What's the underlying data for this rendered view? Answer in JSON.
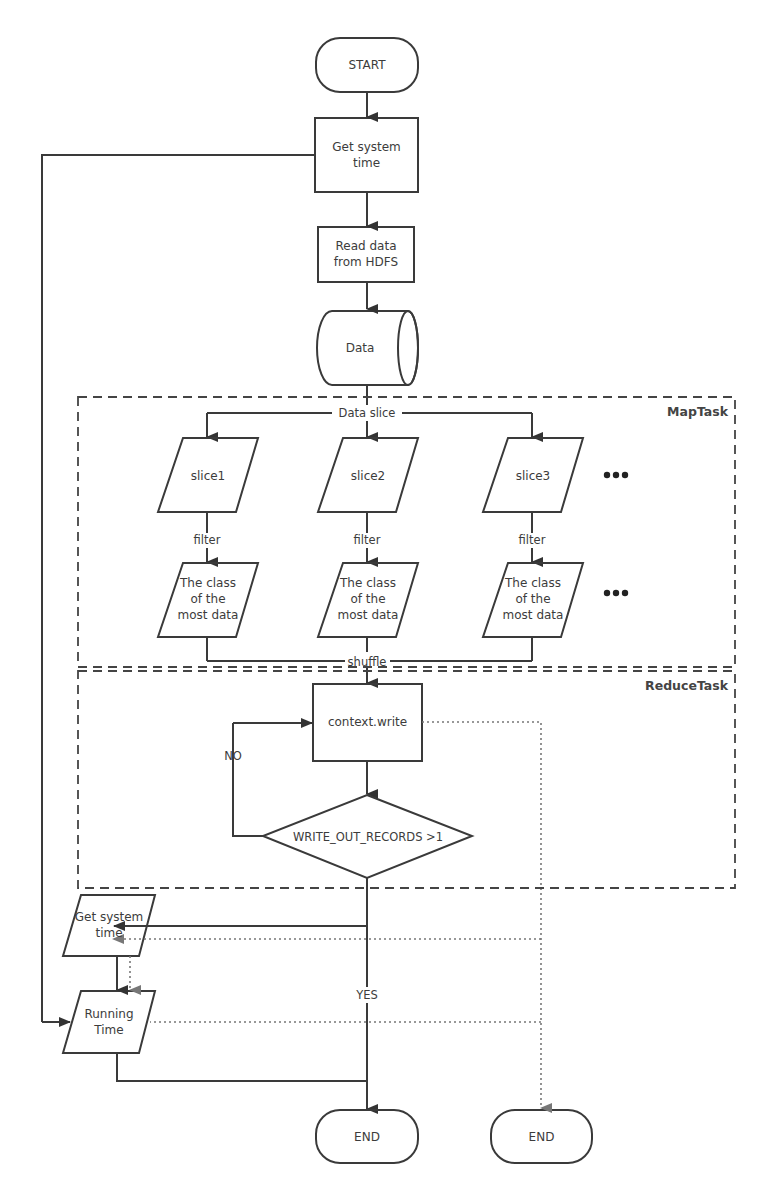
{
  "diagram": {
    "type": "flowchart",
    "groups": {
      "map": {
        "label": "MapTask"
      },
      "reduce": {
        "label": "ReduceTask"
      }
    },
    "nodes": {
      "start": {
        "label": "START",
        "shape": "terminator"
      },
      "get_time_1": {
        "line1": "Get system",
        "line2": "time",
        "shape": "process"
      },
      "read_data": {
        "line1": "Read data",
        "line2": "from HDFS",
        "shape": "process"
      },
      "data": {
        "label": "Data",
        "shape": "cylinder"
      },
      "slices": [
        {
          "label": "slice1",
          "shape": "parallelogram"
        },
        {
          "label": "slice2",
          "shape": "parallelogram"
        },
        {
          "label": "slice3",
          "shape": "parallelogram"
        }
      ],
      "classes": [
        {
          "line1": "The class",
          "line2": "of the",
          "line3": "most data",
          "shape": "parallelogram"
        },
        {
          "line1": "The class",
          "line2": "of the",
          "line3": "most data",
          "shape": "parallelogram"
        },
        {
          "line1": "The class",
          "line2": "of the",
          "line3": "most data",
          "shape": "parallelogram"
        }
      ],
      "ellipsis": "•••",
      "context_write": {
        "label": "context.write",
        "shape": "process"
      },
      "decision": {
        "label": "WRITE_OUT_RECORDS >1",
        "shape": "diamond"
      },
      "get_time_2": {
        "line1": "Get system",
        "line2": "time",
        "shape": "parallelogram"
      },
      "running_time": {
        "line1": "Running",
        "line2": "Time",
        "shape": "parallelogram"
      },
      "end1": {
        "label": "END",
        "shape": "terminator"
      },
      "end2": {
        "label": "END",
        "shape": "terminator"
      }
    },
    "edge_labels": {
      "data_slice": "Data slice",
      "filter": "filter",
      "shuffle": "shuffle",
      "no": "NO",
      "yes": "YES"
    },
    "colors": {
      "stroke": "#3a3a3a",
      "dotted": "#777777",
      "background": "#ffffff"
    }
  }
}
